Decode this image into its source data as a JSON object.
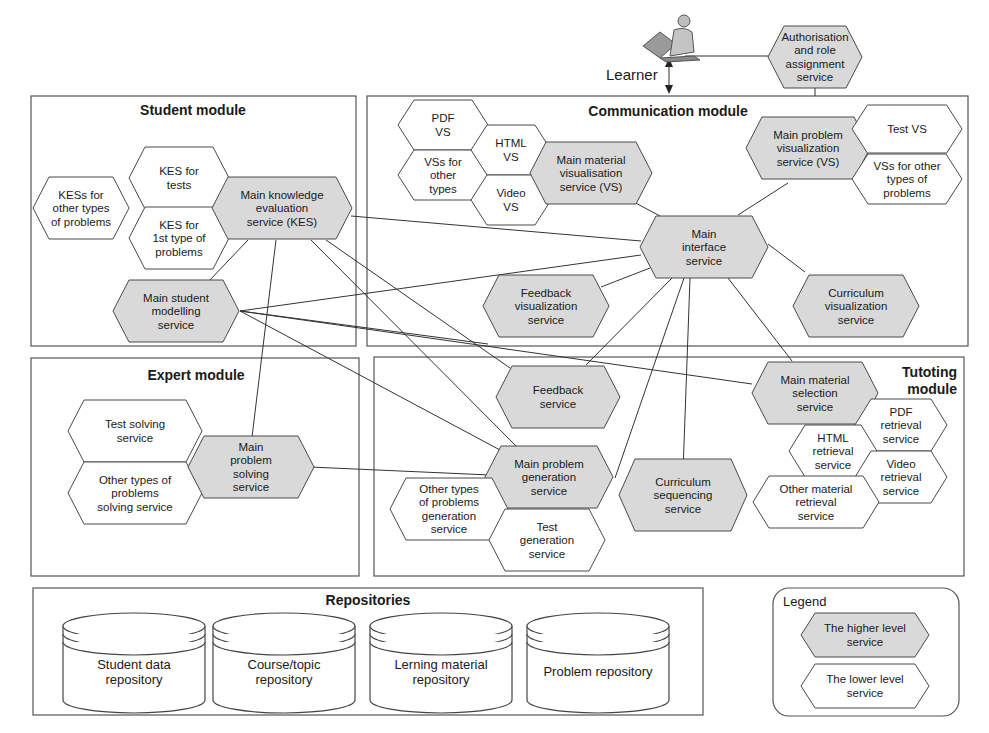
{
  "actor": {
    "label": "Learner",
    "icon": "person-at-computer-icon"
  },
  "auth_service": {
    "lines": [
      "Authorisation",
      "and role",
      "assignment",
      "service"
    ],
    "level": "higher"
  },
  "modules": {
    "student": {
      "title": "Student module",
      "services": {
        "kes_others": {
          "lines": [
            "KESs for",
            "other types",
            "of problems"
          ],
          "level": "lower"
        },
        "kes_tests": {
          "lines": [
            "KES for",
            "tests"
          ],
          "level": "lower"
        },
        "kes_first": {
          "lines": [
            "KES for",
            "1st type of",
            "problems"
          ],
          "level": "lower"
        },
        "main_kes": {
          "lines": [
            "Main knowledge",
            "evaluation",
            "service (KES)"
          ],
          "level": "higher"
        },
        "main_student_modelling": {
          "lines": [
            "Main student",
            "modelling",
            "service"
          ],
          "level": "higher"
        }
      }
    },
    "communication": {
      "title": "Communication module",
      "services": {
        "pdf_vs": {
          "lines": [
            "PDF",
            "VS"
          ],
          "level": "lower"
        },
        "vss_other": {
          "lines": [
            "VSs for",
            "other",
            "types"
          ],
          "level": "lower"
        },
        "html_vs": {
          "lines": [
            "HTML",
            "VS"
          ],
          "level": "lower"
        },
        "video_vs": {
          "lines": [
            "Video",
            "VS"
          ],
          "level": "lower"
        },
        "main_material_vs": {
          "lines": [
            "Main material",
            "visualisation",
            "service (VS)"
          ],
          "level": "higher"
        },
        "main_problem_vs": {
          "lines": [
            "Main problem",
            "visualization",
            "service (VS)"
          ],
          "level": "higher"
        },
        "test_vs": {
          "lines": [
            "Test VS"
          ],
          "level": "lower"
        },
        "vss_other_problems": {
          "lines": [
            "VSs for other",
            "types of",
            "problems"
          ],
          "level": "lower"
        },
        "main_interface": {
          "lines": [
            "Main",
            "interface",
            "service"
          ],
          "level": "higher"
        },
        "feedback_vis": {
          "lines": [
            "Feedback",
            "visualization",
            "service"
          ],
          "level": "higher"
        },
        "curriculum_vis": {
          "lines": [
            "Curriculum",
            "visualization",
            "service"
          ],
          "level": "higher"
        }
      }
    },
    "expert": {
      "title": "Expert module",
      "services": {
        "test_solving": {
          "lines": [
            "Test solving",
            "service"
          ],
          "level": "lower"
        },
        "other_solving": {
          "lines": [
            "Other types of",
            "problems",
            "solving service"
          ],
          "level": "lower"
        },
        "main_problem_solving": {
          "lines": [
            "Main",
            "problem",
            "solving",
            "service"
          ],
          "level": "higher"
        }
      }
    },
    "tutoring": {
      "title_lines": [
        "Tutoting",
        "module"
      ],
      "services": {
        "feedback": {
          "lines": [
            "Feedback",
            "service"
          ],
          "level": "higher"
        },
        "main_problem_gen": {
          "lines": [
            "Main problem",
            "generation",
            "service"
          ],
          "level": "higher"
        },
        "other_gen": {
          "lines": [
            "Other types",
            "of problems",
            "generation",
            "service"
          ],
          "level": "lower"
        },
        "test_gen": {
          "lines": [
            "Test",
            "generation",
            "service"
          ],
          "level": "lower"
        },
        "curriculum_seq": {
          "lines": [
            "Curriculum",
            "sequencing",
            "service"
          ],
          "level": "higher"
        },
        "main_material_sel": {
          "lines": [
            "Main material",
            "selection",
            "service"
          ],
          "level": "higher"
        },
        "pdf_ret": {
          "lines": [
            "PDF",
            "retrieval",
            "service"
          ],
          "level": "lower"
        },
        "html_ret": {
          "lines": [
            "HTML",
            "retrieval",
            "service"
          ],
          "level": "lower"
        },
        "video_ret": {
          "lines": [
            "Video",
            "retrieval",
            "service"
          ],
          "level": "lower"
        },
        "other_ret": {
          "lines": [
            "Other material",
            "retrieval",
            "service"
          ],
          "level": "lower"
        }
      }
    }
  },
  "repositories": {
    "title": "Repositories",
    "items": [
      {
        "lines": [
          "Student data",
          "repository"
        ]
      },
      {
        "lines": [
          "Course/topic",
          "repository"
        ]
      },
      {
        "lines": [
          "Lerning material",
          "repository"
        ]
      },
      {
        "lines": [
          "Problem repository"
        ]
      }
    ]
  },
  "legend": {
    "title": "Legend",
    "items": [
      {
        "lines": [
          "The higher level",
          "service"
        ],
        "level": "higher"
      },
      {
        "lines": [
          "The lower level",
          "service"
        ],
        "level": "lower"
      }
    ]
  },
  "colors": {
    "higher_fill": "#d9d9d9",
    "lower_fill": "#ffffff",
    "stroke": "#4a4a4a"
  }
}
